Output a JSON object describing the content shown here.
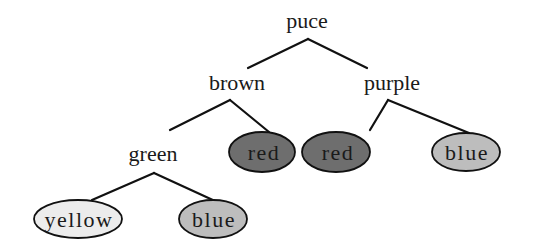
{
  "diagram": {
    "type": "tree",
    "colors": {
      "edge": "#111111",
      "text": "#1a1a1a",
      "fill_dark": "#6e6e6e",
      "fill_medium": "#bdbdbd",
      "fill_light": "#ececec"
    },
    "nodes": {
      "root": {
        "label": "puce",
        "x": 307,
        "y": 28,
        "shape": "text"
      },
      "brown": {
        "label": "brown",
        "x": 237,
        "y": 90,
        "shape": "text"
      },
      "purple": {
        "label": "purple",
        "x": 392,
        "y": 90,
        "shape": "text"
      },
      "green": {
        "label": "green",
        "x": 153,
        "y": 161,
        "shape": "text"
      },
      "red_left": {
        "label": "red",
        "cx": 267,
        "cy": 152,
        "rx": 33,
        "ry": 20,
        "fill": "#6e6e6e",
        "shape": "ellipse"
      },
      "red_right": {
        "label": "red",
        "cx": 341,
        "cy": 152,
        "rx": 34,
        "ry": 20,
        "fill": "#6e6e6e",
        "shape": "ellipse"
      },
      "blue_right": {
        "label": "blue",
        "cx": 466,
        "cy": 152,
        "rx": 34,
        "ry": 19,
        "fill": "#bdbdbd",
        "shape": "ellipse"
      },
      "yellow": {
        "label": "yellow",
        "cx": 78,
        "cy": 219,
        "rx": 44,
        "ry": 19,
        "fill": "#ececec",
        "shape": "ellipse"
      },
      "blue_left": {
        "label": "blue",
        "cx": 213,
        "cy": 219,
        "rx": 34,
        "ry": 19,
        "fill": "#bdbdbd",
        "shape": "ellipse"
      }
    },
    "edges": [
      {
        "from": "puce",
        "to": "brown"
      },
      {
        "from": "puce",
        "to": "purple"
      },
      {
        "from": "brown",
        "to": "green"
      },
      {
        "from": "brown",
        "to": "red"
      },
      {
        "from": "purple",
        "to": "red"
      },
      {
        "from": "purple",
        "to": "blue"
      },
      {
        "from": "green",
        "to": "yellow"
      },
      {
        "from": "green",
        "to": "blue"
      }
    ]
  }
}
